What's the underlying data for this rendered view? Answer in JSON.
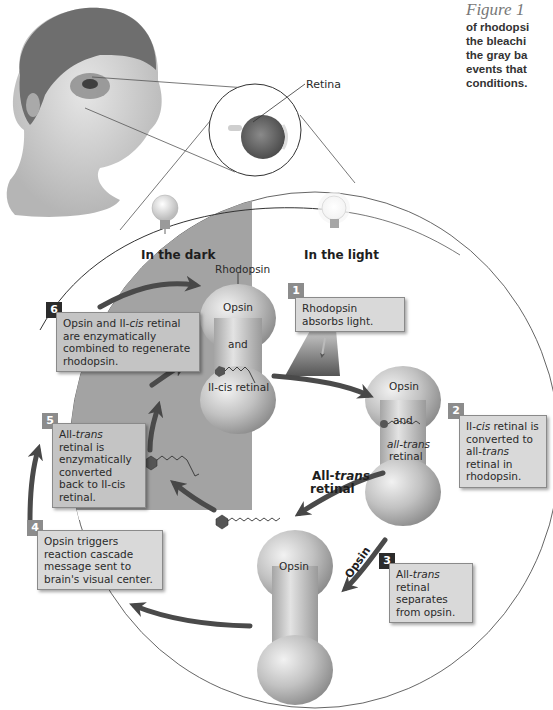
{
  "caption": {
    "figure_label": "Figure 1",
    "lines": [
      "of rhodopsi",
      "the bleachi",
      "the gray ba",
      "events that",
      "conditions."
    ]
  },
  "labels": {
    "retina": "Retina",
    "in_the_dark": "In the dark",
    "in_the_light": "In the light",
    "rhodopsin": "Rhodopsin",
    "all_trans_retinal_arrow_1": "All-",
    "all_trans_retinal_arrow_2": "trans",
    "all_trans_retinal_arrow_3": "retinal",
    "opsin_arrow": "Opsin"
  },
  "molecules": {
    "rhodopsin": {
      "top": "Opsin",
      "mid": "and",
      "bottom": "II-cis retinal"
    },
    "activated": {
      "top": "Opsin",
      "mid": "and",
      "bottom1": "all-trans",
      "bottom2": "retinal"
    },
    "opsin": {
      "top": "Opsin"
    }
  },
  "steps": [
    {
      "number": "1",
      "style": "gray",
      "text": "Rhodopsin absorbs light."
    },
    {
      "number": "2",
      "style": "gray",
      "pre": "II-",
      "em": "cis",
      "post": " retinal is converted to all-",
      "em2": "trans",
      "post2": " retinal in rhodopsin."
    },
    {
      "number": "3",
      "style": "black",
      "pre": "All-",
      "em": "trans",
      "post": " retinal separates from opsin."
    },
    {
      "number": "4",
      "style": "gray",
      "text": "Opsin triggers reaction cascade message sent to brain's visual center."
    },
    {
      "number": "5",
      "style": "gray",
      "pre": "All-",
      "em": "trans",
      "post": " retinal is enzymatically converted back to II-cis retinal."
    },
    {
      "number": "6",
      "style": "black",
      "pre": "Opsin and II-",
      "em": "cis",
      "post": " retinal are enzymatically combined to regenerate rhodopsin."
    }
  ],
  "colors": {
    "dark_region": "#9e9e9e",
    "box_fill": "#d9d9d9",
    "arrow": "#4a4a4a",
    "molecule": "#b8b8b8"
  }
}
